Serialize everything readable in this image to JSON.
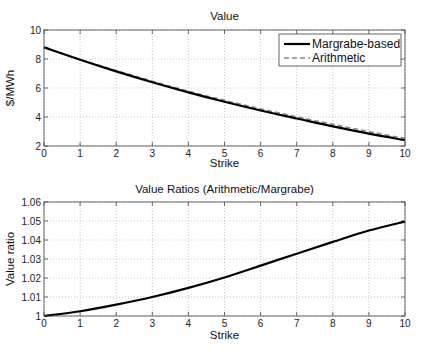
{
  "chart_data": [
    {
      "type": "line",
      "title": "Value",
      "xlabel": "Strike",
      "ylabel": "$/MWh",
      "xlim": [
        0,
        10
      ],
      "ylim": [
        2,
        10
      ],
      "xticks": [
        "0",
        "1",
        "2",
        "3",
        "4",
        "5",
        "6",
        "7",
        "8",
        "9",
        "10"
      ],
      "yticks": [
        "2",
        "4",
        "6",
        "8",
        "10"
      ],
      "grid": true,
      "legend_position": "upper right",
      "x": [
        0,
        1,
        2,
        3,
        4,
        5,
        6,
        7,
        8,
        9,
        10
      ],
      "series": [
        {
          "name": "Margrabe-based",
          "style": "solid",
          "values": [
            8.8,
            7.95,
            7.15,
            6.4,
            5.7,
            5.05,
            4.45,
            3.9,
            3.35,
            2.85,
            2.4
          ]
        },
        {
          "name": "Arithmetic",
          "style": "dashed",
          "values": [
            8.8,
            7.97,
            7.2,
            6.47,
            5.78,
            5.15,
            4.56,
            4.02,
            3.49,
            2.99,
            2.52
          ]
        }
      ]
    },
    {
      "type": "line",
      "title": "Value Ratios (Arithmetic/Margrabe)",
      "xlabel": "Strike",
      "ylabel": "Value ratio",
      "xlim": [
        0,
        10
      ],
      "ylim": [
        1,
        1.06
      ],
      "xticks": [
        "0",
        "1",
        "2",
        "3",
        "4",
        "5",
        "6",
        "7",
        "8",
        "9",
        "10"
      ],
      "yticks": [
        "1",
        "1.01",
        "1.02",
        "1.03",
        "1.04",
        "1.05",
        "1.06"
      ],
      "grid": true,
      "x": [
        0,
        1,
        2,
        3,
        4,
        5,
        6,
        7,
        8,
        9,
        10
      ],
      "series": [
        {
          "name": "Value ratio",
          "style": "solid",
          "values": [
            1.0,
            1.0025,
            1.006,
            1.01,
            1.0148,
            1.0203,
            1.0265,
            1.0328,
            1.039,
            1.045,
            1.0497
          ]
        }
      ]
    }
  ],
  "legend": {
    "items": [
      {
        "label": "Margrabe-based"
      },
      {
        "label": "Arithmetic"
      }
    ]
  }
}
